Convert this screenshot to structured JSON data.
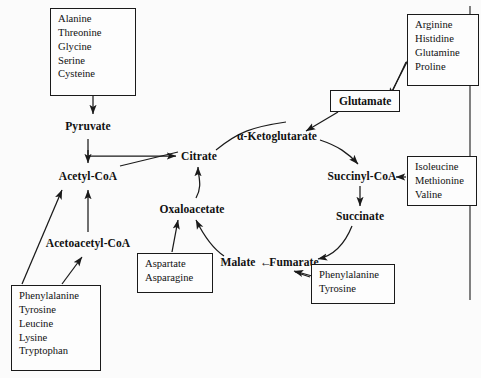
{
  "diagram": {
    "border_color": "#2a2a2a",
    "line_color": "#1a1a1a",
    "text_color": "#111111",
    "metabolites": [
      {
        "id": "pyruvate",
        "label": "Pyruvate",
        "x": 88,
        "y": 126
      },
      {
        "id": "acetyl-coa",
        "label": "Acetyl-CoA",
        "x": 88,
        "y": 176
      },
      {
        "id": "acetoacetyl-coa",
        "label": "Acetoacetyl-CoA",
        "x": 88,
        "y": 243
      },
      {
        "id": "citrate",
        "label": "Citrate",
        "x": 199,
        "y": 156
      },
      {
        "id": "oxaloacetate",
        "label": "Oxaloacetate",
        "x": 192,
        "y": 209
      },
      {
        "id": "ketoglutarate",
        "label": "α-Ketoglutarate",
        "x": 277,
        "y": 136
      },
      {
        "id": "succinyl-coa",
        "label": "Succinyl-CoA",
        "x": 362,
        "y": 176
      },
      {
        "id": "succinate",
        "label": "Succinate",
        "x": 360,
        "y": 216
      },
      {
        "id": "fumarate",
        "label": "Fumarate",
        "x": 294,
        "y": 262
      },
      {
        "id": "malate",
        "label": "Malate",
        "x": 238,
        "y": 262
      },
      {
        "id": "malate-arrow",
        "label": "←",
        "x": 266,
        "y": 262
      }
    ],
    "groups": [
      {
        "id": "serine-family",
        "x": 50,
        "y": 8,
        "w": 86,
        "h": 88,
        "items": [
          "Alanine",
          "Threonine",
          "Glycine",
          "Serine",
          "Cysteine"
        ]
      },
      {
        "id": "glutamate-family",
        "x": 407,
        "y": 14,
        "w": 72,
        "h": 72,
        "items": [
          "Arginine",
          "Histidine",
          "Glutamine",
          "Proline"
        ]
      },
      {
        "id": "glutamate",
        "x": 330,
        "y": 90,
        "w": 70,
        "h": 22,
        "single": "Glutamate"
      },
      {
        "id": "succinyl-family",
        "x": 407,
        "y": 156,
        "w": 70,
        "h": 50,
        "items": [
          "Isoleucine",
          "Methionine",
          "Valine"
        ]
      },
      {
        "id": "aspartate-family",
        "x": 137,
        "y": 253,
        "w": 76,
        "h": 40,
        "items": [
          "Aspartate",
          "Asparagine"
        ]
      },
      {
        "id": "fumarate-family",
        "x": 311,
        "y": 264,
        "w": 84,
        "h": 40,
        "items": [
          "Phenylalanine",
          "Tyrosine"
        ]
      },
      {
        "id": "ketogenic-family",
        "x": 11,
        "y": 285,
        "w": 90,
        "h": 86,
        "items": [
          "Phenylalanine",
          "Tyrosine",
          "Leucine",
          "Lysine",
          "Tryptophan"
        ]
      }
    ],
    "edges": [
      {
        "from": "serine-family",
        "to": "pyruvate",
        "style": "straight"
      },
      {
        "from": "pyruvate",
        "to": "acetyl-coa",
        "style": "straight"
      },
      {
        "from": "pyruvate",
        "to": "citrate",
        "style": "elbow"
      },
      {
        "from": "acetoacetyl-coa",
        "to": "acetyl-coa",
        "style": "straight"
      },
      {
        "from": "ketogenic-family",
        "to": "acetyl-coa",
        "style": "diagonal"
      },
      {
        "from": "ketogenic-family",
        "to": "acetoacetyl-coa",
        "style": "diagonal"
      },
      {
        "from": "oxaloacetate",
        "to": "citrate",
        "style": "curve"
      },
      {
        "from": "citrate",
        "to": "ketoglutarate",
        "style": "curve"
      },
      {
        "from": "glutamate-family",
        "to": "glutamate",
        "style": "diagonal"
      },
      {
        "from": "glutamate",
        "to": "ketoglutarate",
        "style": "diagonal"
      },
      {
        "from": "ketoglutarate",
        "to": "succinyl-coa",
        "style": "curve"
      },
      {
        "from": "succinyl-family",
        "to": "succinyl-coa",
        "style": "straight"
      },
      {
        "from": "succinyl-coa",
        "to": "succinate",
        "style": "straight"
      },
      {
        "from": "succinate",
        "to": "fumarate",
        "style": "curve"
      },
      {
        "from": "fumarate",
        "to": "malate",
        "style": "inline-arrow"
      },
      {
        "from": "malate",
        "to": "oxaloacetate",
        "style": "curve"
      },
      {
        "from": "aspartate-family",
        "to": "oxaloacetate",
        "style": "straight"
      },
      {
        "from": "fumarate-family",
        "to": "fumarate",
        "style": "diagonal"
      }
    ]
  }
}
